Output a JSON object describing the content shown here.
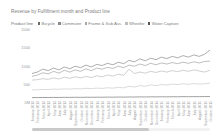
{
  "title": "Revenue by Fulfillment month and Product line",
  "legend": {
    "title": "Product line",
    "items": [
      {
        "label": "Bicycle",
        "color": "#6b6b6b"
      },
      {
        "label": "Commuter",
        "color": "#8a8a8a"
      },
      {
        "label": "Frame & Sub Ass.",
        "color": "#a8a8a8"
      },
      {
        "label": "Wheeler",
        "color": "#bdbdbd"
      },
      {
        "label": "Water Capture",
        "color": "#555555"
      }
    ]
  },
  "scrollbar": {
    "orientation": "horizontal",
    "thumb_fraction": 0.66
  },
  "chart_data": {
    "type": "line",
    "title": "Revenue by Fulfillment month and Product line",
    "xlabel": "Fulfillment month",
    "ylabel": "Revenue",
    "ylim": [
      0,
      2000
    ],
    "yticks": [
      0,
      500,
      1000,
      1500,
      2000
    ],
    "ytick_labels": [
      "0M",
      "500",
      "1000",
      "1500",
      "2000"
    ],
    "grid": false,
    "legend_position": "top",
    "categories": [
      "January 2013",
      "February 2013",
      "March 2013",
      "April 2013",
      "May 2013",
      "June 2013",
      "July 2013",
      "August 2013",
      "September 2013",
      "October 2013",
      "November 2013",
      "December 2013",
      "January 2014",
      "February 2014",
      "March 2014",
      "April 2014",
      "May 2014",
      "June 2014",
      "July 2014",
      "August 2014",
      "September 2014",
      "October 2014",
      "November 2014",
      "December 2014",
      "January 2015",
      "February 2015",
      "March 2015",
      "April 2015",
      "May 2015",
      "June 2015",
      "July 2015",
      "August 2015",
      "September 2015",
      "October 2015"
    ],
    "series": [
      {
        "name": "Bicycle",
        "color": "#6b6b6b",
        "values": [
          780,
          820,
          900,
          860,
          930,
          880,
          960,
          910,
          980,
          940,
          1010,
          960,
          1030,
          1000,
          1060,
          1020,
          1090,
          1050,
          1140,
          1100,
          1180,
          1130,
          1200,
          1160,
          1230,
          1190,
          1250,
          1210,
          1270,
          1230,
          1290,
          1250,
          1310,
          1420
        ]
      },
      {
        "name": "Commuter",
        "color": "#8a8a8a",
        "values": [
          700,
          740,
          800,
          770,
          840,
          790,
          870,
          820,
          880,
          840,
          910,
          860,
          930,
          900,
          950,
          920,
          980,
          940,
          1010,
          980,
          1040,
          1000,
          1060,
          1020,
          1070,
          1040,
          1080,
          1050,
          1090,
          1060,
          1100,
          1070,
          1110,
          1120
        ]
      },
      {
        "name": "Frame & Sub Ass.",
        "color": "#a8a8a8",
        "values": [
          600,
          610,
          640,
          620,
          660,
          630,
          680,
          650,
          690,
          660,
          700,
          670,
          720,
          690,
          740,
          710,
          760,
          730,
          900,
          780,
          820,
          790,
          840,
          810,
          850,
          820,
          860,
          830,
          870,
          840,
          880,
          850,
          820,
          870
        ]
      },
      {
        "name": "Wheeler",
        "color": "#bdbdbd",
        "values": [
          330,
          335,
          345,
          340,
          355,
          348,
          360,
          352,
          368,
          358,
          375,
          365,
          380,
          372,
          390,
          380,
          400,
          388,
          430,
          410,
          450,
          430,
          470,
          450,
          480,
          465,
          490,
          475,
          500,
          485,
          505,
          492,
          498,
          520
        ]
      },
      {
        "name": "Water Capture",
        "color": "#555555",
        "values": [
          120,
          122,
          124,
          123,
          126,
          124,
          128,
          126,
          129,
          127,
          131,
          129,
          132,
          130,
          134,
          132,
          136,
          134,
          138,
          136,
          140,
          138,
          142,
          140,
          143,
          141,
          145,
          143,
          147,
          145,
          148,
          146,
          149,
          150
        ]
      }
    ]
  }
}
